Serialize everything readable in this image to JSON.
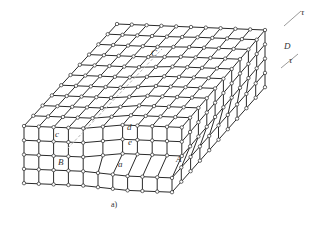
{
  "figure": {
    "caption": "a)",
    "line_color": "#2a2a2a",
    "node_fill": "#ffffff",
    "arrow_color": "#9a9a9a"
  },
  "labels": {
    "A": "A",
    "B": "B",
    "C": "C",
    "D": "D",
    "a": "a",
    "c": "c",
    "d": "d",
    "e": "e",
    "tau_top": "τ",
    "tau_bottom": "τ"
  },
  "lattice": {
    "front_cols": 11,
    "rows": 4,
    "depth": 10,
    "origin": [
      24,
      126
    ],
    "col_step": [
      14.8,
      0.6
    ],
    "row_step": [
      0,
      14.3
    ],
    "depth_step": [
      9.3,
      -10.2
    ],
    "step_col": 5,
    "step_rows": 2,
    "step_shift": 14
  }
}
